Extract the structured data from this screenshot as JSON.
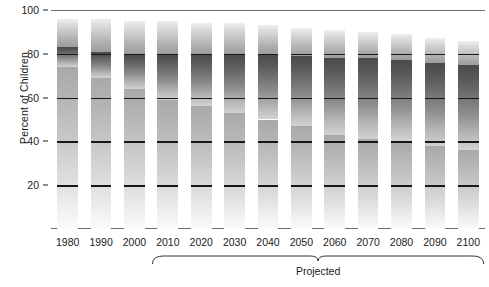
{
  "chart_data": {
    "type": "bar",
    "subtype": "stacked-bar",
    "title": "",
    "xlabel": "",
    "ylabel": "Percent of Children",
    "ylim": [
      0,
      100
    ],
    "yticks": [
      20,
      40,
      60,
      80,
      100
    ],
    "ytick_labels": [
      "20",
      "40",
      "60",
      "80",
      "100"
    ],
    "grid": false,
    "legend_position": "none",
    "categories": [
      "1980",
      "1990",
      "2000",
      "2010",
      "2020",
      "2030",
      "2040",
      "2050",
      "2060",
      "2070",
      "2080",
      "2090",
      "2100"
    ],
    "series": [
      {
        "name": "bottom-segment",
        "values": [
          74,
          69,
          64,
          59,
          56,
          53,
          50,
          47,
          43,
          41,
          40,
          38,
          36
        ]
      },
      {
        "name": "middle-segment",
        "values": [
          9,
          12,
          16,
          21,
          24,
          27,
          30,
          32,
          35,
          37,
          37,
          38,
          39
        ]
      },
      {
        "name": "top-segment",
        "values": [
          13,
          15,
          15,
          15,
          14,
          14,
          13,
          13,
          13,
          12,
          12,
          11,
          11
        ]
      }
    ],
    "segment_tops": {
      "bottom": [
        74,
        69,
        64,
        59,
        56,
        53,
        50,
        47,
        43,
        41,
        40,
        38,
        36
      ],
      "middle": [
        83,
        81,
        80,
        80,
        80,
        80,
        80,
        79,
        78,
        78,
        77,
        76,
        75
      ],
      "total": [
        96,
        96,
        95,
        95,
        94,
        94,
        93,
        92,
        91,
        90,
        89,
        87,
        86
      ]
    },
    "annotations": [
      {
        "text": "Projected",
        "spans": [
          "2010",
          "2100"
        ],
        "type": "bracket"
      }
    ]
  },
  "axis": {
    "y_title": "Percent of Children"
  },
  "bracket": {
    "label": "Projected"
  }
}
